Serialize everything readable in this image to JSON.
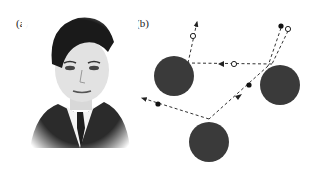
{
  "panels": {
    "a": {
      "label": "(a)"
    },
    "b": {
      "label": "(b)"
    }
  },
  "colors": {
    "scatterer": "#3a3a3a",
    "path": "#333333",
    "background": "#ffffff"
  }
}
